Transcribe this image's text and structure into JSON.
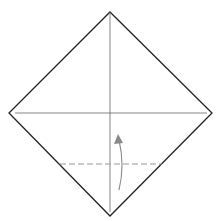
{
  "diagram": {
    "type": "origami-fold-step",
    "colors": {
      "outline": "#222222",
      "crease": "#555555",
      "valley_fold": "#999999",
      "arrow": "#888888"
    },
    "square": {
      "top": [
        110,
        12
      ],
      "right": [
        212,
        113
      ],
      "bottom": [
        110,
        216
      ],
      "left": [
        9,
        113
      ]
    },
    "creases": [
      {
        "name": "horizontal",
        "x1": 15,
        "y1": 113,
        "x2": 207,
        "y2": 113
      },
      {
        "name": "vertical",
        "x1": 110,
        "y1": 12,
        "x2": 110,
        "y2": 212
      }
    ],
    "valley_fold_line": {
      "x1": 60,
      "y1": 164,
      "x2": 162,
      "y2": 164
    },
    "fold_arrow": {
      "direction": "up",
      "from": [
        119,
        190
      ],
      "to": [
        119,
        136
      ]
    }
  }
}
